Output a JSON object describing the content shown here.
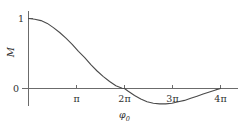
{
  "figure": {
    "background_color": "#ffffff",
    "axis_color": "#6b6b6b",
    "curve_color": "#4a4a4a",
    "text_color": "#2f2f2f"
  },
  "axes": {
    "y_title": "M",
    "x_title": "",
    "y_ticks": [
      {
        "label": "1",
        "value": 1
      },
      {
        "label": "0",
        "value": 0
      }
    ],
    "x_ticks": [
      {
        "label": "π",
        "value": 3.14159
      },
      {
        "label": "2π",
        "value": 6.28319
      },
      {
        "label": "3π",
        "value": 9.42478
      },
      {
        "label": "4π",
        "value": 12.56637
      }
    ]
  },
  "annotations": [
    {
      "name": "phi-zero-label",
      "base": "φ",
      "subscript": "0",
      "at_x": 6.28319,
      "at_y": 0
    }
  ],
  "chart_data": {
    "type": "line",
    "title": "",
    "xlabel": "",
    "ylabel": "M",
    "xlim": [
      0,
      13.2
    ],
    "ylim": [
      -0.3,
      1.05
    ],
    "grid": false,
    "legend": null,
    "series": [
      {
        "name": "M",
        "x": [
          0.0,
          0.41,
          0.82,
          1.23,
          1.63,
          2.04,
          2.45,
          2.86,
          3.27,
          3.68,
          4.08,
          4.49,
          4.9,
          5.31,
          5.72,
          6.13,
          6.28,
          6.53,
          6.94,
          7.35,
          7.76,
          8.17,
          8.58,
          8.98,
          9.39,
          9.8,
          10.21,
          10.62,
          11.03,
          11.43,
          11.84,
          12.25,
          12.57
        ],
        "y": [
          1.0,
          0.99,
          0.97,
          0.93,
          0.87,
          0.8,
          0.72,
          0.63,
          0.53,
          0.44,
          0.34,
          0.25,
          0.17,
          0.1,
          0.04,
          0.003,
          0.0,
          -0.04,
          -0.1,
          -0.15,
          -0.19,
          -0.21,
          -0.22,
          -0.22,
          -0.21,
          -0.19,
          -0.17,
          -0.14,
          -0.11,
          -0.08,
          -0.05,
          -0.02,
          0.0
        ]
      }
    ],
    "notable_points": [
      {
        "label": "start",
        "x": 0,
        "y": 1
      },
      {
        "label": "zero-crossing",
        "x": 6.28319,
        "y": 0
      },
      {
        "label": "minimum",
        "x": 8.9,
        "y": -0.22
      },
      {
        "label": "end",
        "x": 12.56637,
        "y": 0
      }
    ]
  }
}
